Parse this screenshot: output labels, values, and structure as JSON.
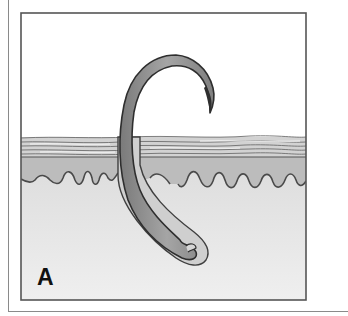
{
  "figure": {
    "panel_label": "A",
    "layers": [
      "stratum-corneum",
      "epidermis",
      "dermis"
    ],
    "colors": {
      "background": "#ffffff",
      "frame": "#555555",
      "stratum_corneum": "#c8c8c8",
      "epidermis": "#bdbdbd",
      "dermis": "#e8e8e8",
      "hair_fill": "#8f8f8f",
      "hair_outline": "#2e2e2e"
    }
  }
}
